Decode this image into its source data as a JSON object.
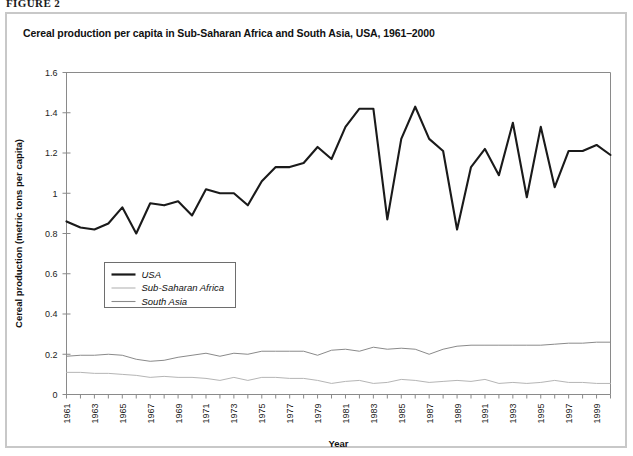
{
  "figure_label": "FIGURE 2",
  "chart_title": "Cereal production per capita in Sub-Saharan Africa and South Asia, USA, 1961–2000",
  "axes": {
    "ylabel": "Cereal production (metric tons per capita)",
    "xlabel": "Year",
    "ytick_labels": [
      "0",
      "0.2",
      "0.4",
      "0.6",
      "0.8",
      "1",
      "1.2",
      "1.4",
      "1.6"
    ],
    "xtick_labels": [
      "1961",
      "1963",
      "1965",
      "1967",
      "1969",
      "1971",
      "1973",
      "1975",
      "1977",
      "1979",
      "1981",
      "1983",
      "1985",
      "1987",
      "1989",
      "1991",
      "1993",
      "1995",
      "1997",
      "1999"
    ]
  },
  "legend": {
    "items": [
      {
        "label": "USA",
        "color": "#1a1a1a",
        "width": 2.2
      },
      {
        "label": "Sub-Saharan Africa",
        "color": "#b5b5b5",
        "width": 1.1
      },
      {
        "label": "South Asia",
        "color": "#8a8a8a",
        "width": 1.1
      }
    ]
  },
  "colors": {
    "frame": "#c8c8c8",
    "axis": "#8a8a8a",
    "usa": "#1a1a1a",
    "ssa": "#b5b5b5",
    "south_asia": "#8a8a8a",
    "background": "#ffffff"
  },
  "chart_data": {
    "type": "line",
    "title": "Cereal production per capita in Sub-Saharan Africa and South Asia, USA, 1961–2000",
    "xlabel": "Year",
    "ylabel": "Cereal production (metric tons per capita)",
    "xlim": [
      1961,
      2000
    ],
    "ylim": [
      0,
      1.6
    ],
    "ytick_values": [
      0,
      0.2,
      0.4,
      0.6,
      0.8,
      1.0,
      1.2,
      1.4,
      1.6
    ],
    "grid": false,
    "legend_position": "inside-left-middle",
    "x": [
      1961,
      1962,
      1963,
      1964,
      1965,
      1966,
      1967,
      1968,
      1969,
      1970,
      1971,
      1972,
      1973,
      1974,
      1975,
      1976,
      1977,
      1978,
      1979,
      1980,
      1981,
      1982,
      1983,
      1984,
      1985,
      1986,
      1987,
      1988,
      1989,
      1990,
      1991,
      1992,
      1993,
      1994,
      1995,
      1996,
      1997,
      1998,
      1999,
      2000
    ],
    "series": [
      {
        "name": "USA",
        "color": "#1a1a1a",
        "values": [
          0.86,
          0.83,
          0.82,
          0.85,
          0.93,
          0.8,
          0.95,
          0.94,
          0.96,
          0.89,
          1.02,
          1.0,
          1.0,
          0.94,
          1.06,
          1.13,
          1.13,
          1.15,
          1.23,
          1.17,
          1.33,
          1.42,
          1.42,
          0.87,
          1.27,
          1.43,
          1.27,
          1.21,
          0.82,
          1.13,
          1.22,
          1.09,
          1.35,
          0.98,
          1.33,
          1.03,
          1.21,
          1.21,
          1.24,
          1.19
        ]
      },
      {
        "name": "South Asia",
        "color": "#8a8a8a",
        "values": [
          0.19,
          0.195,
          0.195,
          0.2,
          0.195,
          0.175,
          0.165,
          0.17,
          0.185,
          0.195,
          0.205,
          0.19,
          0.205,
          0.2,
          0.215,
          0.215,
          0.215,
          0.215,
          0.195,
          0.22,
          0.225,
          0.215,
          0.235,
          0.225,
          0.23,
          0.225,
          0.2,
          0.225,
          0.24,
          0.245,
          0.245,
          0.245,
          0.245,
          0.245,
          0.245,
          0.25,
          0.255,
          0.255,
          0.26,
          0.26
        ]
      },
      {
        "name": "Sub-Saharan Africa",
        "color": "#b5b5b5",
        "values": [
          0.11,
          0.11,
          0.105,
          0.105,
          0.1,
          0.095,
          0.085,
          0.09,
          0.085,
          0.085,
          0.08,
          0.07,
          0.085,
          0.07,
          0.085,
          0.085,
          0.08,
          0.08,
          0.07,
          0.055,
          0.065,
          0.07,
          0.055,
          0.06,
          0.075,
          0.07,
          0.06,
          0.065,
          0.07,
          0.065,
          0.075,
          0.055,
          0.06,
          0.055,
          0.06,
          0.07,
          0.06,
          0.06,
          0.055,
          0.055
        ]
      }
    ]
  }
}
